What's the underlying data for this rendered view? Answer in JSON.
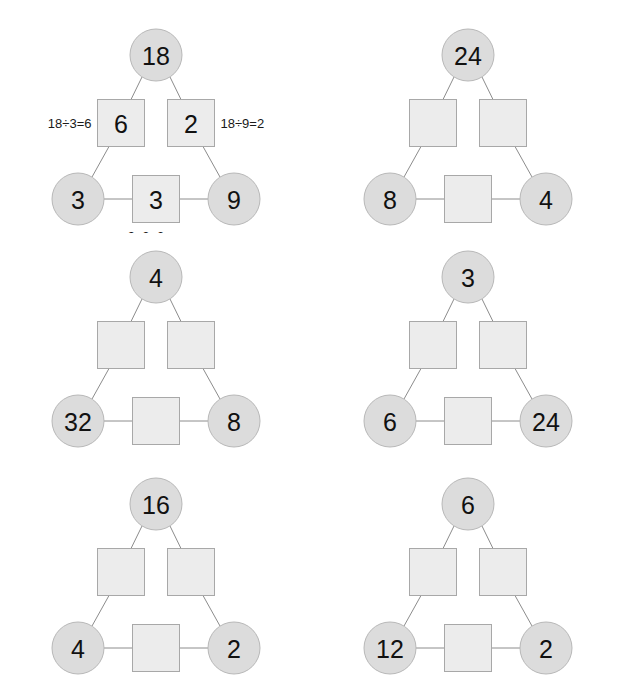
{
  "worksheet": {
    "shape_names": {
      "circle": "circle-node",
      "square": "square-node"
    },
    "colors": {
      "circle_fill": "#dcdcdc",
      "circle_stroke": "#b8b8b8",
      "square_fill": "#ececec",
      "square_stroke": "#a8a8a8",
      "edge": "#8c8c8c",
      "text": "#111111",
      "background": "#ffffff"
    }
  },
  "puzzles": [
    {
      "id": "puzzle-1",
      "top": "18",
      "left_square": "6",
      "right_square": "2",
      "bottom_left": "3",
      "bottom_right": "9",
      "bottom_square": "3",
      "hint_left": "18÷3=6",
      "hint_right": "18÷9=2",
      "hint_bottom": "9÷3=3"
    },
    {
      "id": "puzzle-2",
      "top": "24",
      "left_square": "",
      "right_square": "",
      "bottom_left": "8",
      "bottom_right": "4",
      "bottom_square": "",
      "hint_left": "",
      "hint_right": "",
      "hint_bottom": ""
    },
    {
      "id": "puzzle-3",
      "top": "4",
      "left_square": "",
      "right_square": "",
      "bottom_left": "32",
      "bottom_right": "8",
      "bottom_square": "",
      "hint_left": "",
      "hint_right": "",
      "hint_bottom": ""
    },
    {
      "id": "puzzle-4",
      "top": "3",
      "left_square": "",
      "right_square": "",
      "bottom_left": "6",
      "bottom_right": "24",
      "bottom_square": "",
      "hint_left": "",
      "hint_right": "",
      "hint_bottom": ""
    },
    {
      "id": "puzzle-5",
      "top": "16",
      "left_square": "",
      "right_square": "",
      "bottom_left": "4",
      "bottom_right": "2",
      "bottom_square": "",
      "hint_left": "",
      "hint_right": "",
      "hint_bottom": ""
    },
    {
      "id": "puzzle-6",
      "top": "6",
      "left_square": "",
      "right_square": "",
      "bottom_left": "12",
      "bottom_right": "2",
      "bottom_square": "",
      "hint_left": "",
      "hint_right": "",
      "hint_bottom": ""
    }
  ]
}
